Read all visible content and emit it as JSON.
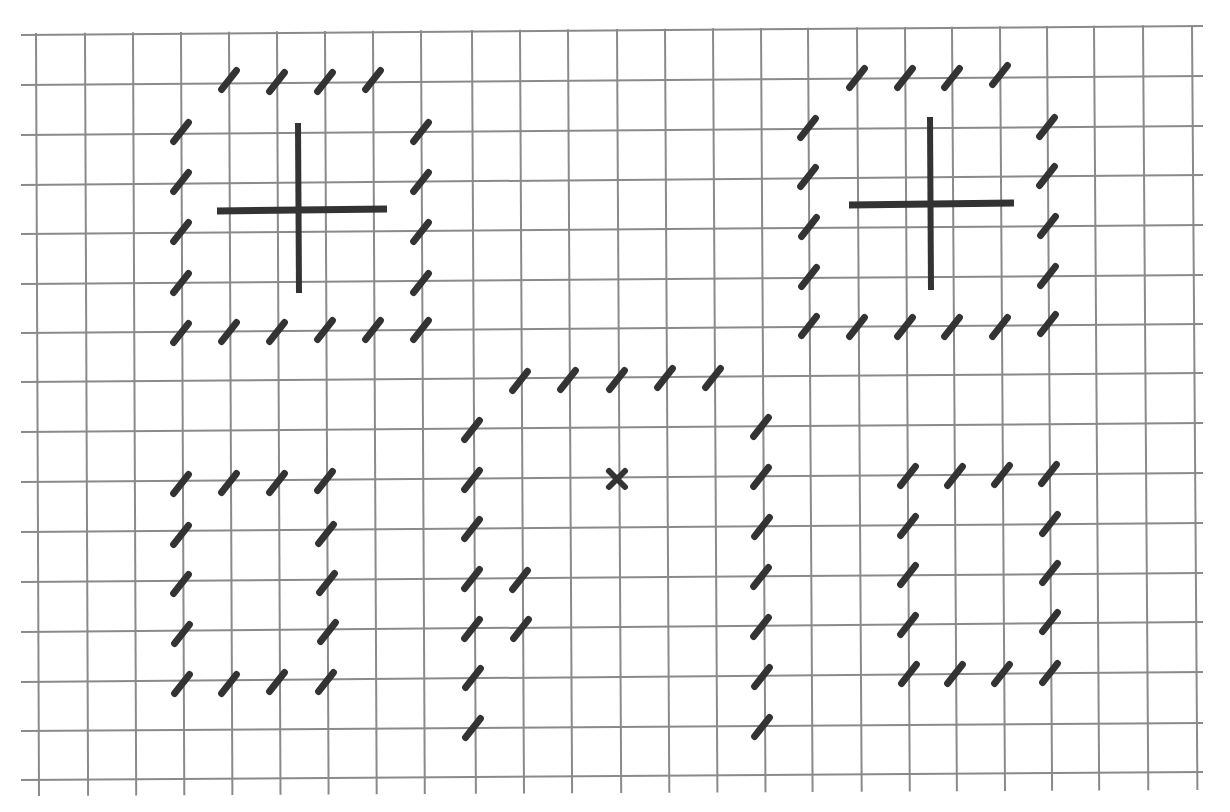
{
  "canvas": {
    "width": 1230,
    "height": 812,
    "background": "#ffffff"
  },
  "grid": {
    "line_color": "#8a8a8a",
    "line_width": 2,
    "columns_x": [
      36,
      85,
      133,
      181,
      229,
      277,
      325,
      373,
      421,
      472,
      520,
      568,
      617,
      665,
      713,
      761,
      808,
      857,
      905,
      952,
      1000,
      1047,
      1094,
      1143,
      1192
    ],
    "rows_y_left": [
      35,
      85,
      135,
      185,
      234,
      284,
      333,
      382,
      432,
      482,
      532,
      582,
      632,
      682,
      731,
      780
    ],
    "rows_y_right": [
      26,
      76,
      126,
      175,
      225,
      275,
      324,
      373,
      423,
      473,
      523,
      573,
      622,
      672,
      723,
      772
    ],
    "h_extent": [
      21,
      1203
    ],
    "v_extent_top": 27,
    "v_extent_bottom": 796
  },
  "mark_style": {
    "color": "#333333",
    "length": 24,
    "width": 7,
    "angle_deg": -52
  },
  "figures": [
    {
      "name": "top-left-box",
      "marks": [
        [
          229,
          80
        ],
        [
          277,
          82
        ],
        [
          325,
          82
        ],
        [
          373,
          80
        ],
        [
          181,
          132
        ],
        [
          181,
          182
        ],
        [
          181,
          232
        ],
        [
          181,
          283
        ],
        [
          421,
          132
        ],
        [
          421,
          182
        ],
        [
          421,
          232
        ],
        [
          421,
          283
        ],
        [
          181,
          333
        ],
        [
          229,
          332
        ],
        [
          277,
          332
        ],
        [
          325,
          330
        ],
        [
          373,
          330
        ],
        [
          421,
          330
        ]
      ],
      "plus": {
        "h": [
          217,
          211,
          387,
          209
        ],
        "v": [
          298,
          123,
          299,
          293
        ]
      }
    },
    {
      "name": "top-right-box",
      "marks": [
        [
          857,
          78
        ],
        [
          905,
          78
        ],
        [
          952,
          78
        ],
        [
          1000,
          75
        ],
        [
          808,
          128
        ],
        [
          808,
          177
        ],
        [
          809,
          227
        ],
        [
          809,
          277
        ],
        [
          1047,
          127
        ],
        [
          1047,
          176
        ],
        [
          1048,
          226
        ],
        [
          1048,
          276
        ],
        [
          809,
          326
        ],
        [
          857,
          327
        ],
        [
          905,
          327
        ],
        [
          952,
          327
        ],
        [
          1000,
          327
        ],
        [
          1048,
          324
        ]
      ],
      "plus": {
        "h": [
          849,
          205,
          1014,
          203
        ],
        "v": [
          930,
          117,
          931,
          290
        ]
      }
    },
    {
      "name": "center-box",
      "marks": [
        [
          520,
          381
        ],
        [
          568,
          380
        ],
        [
          617,
          380
        ],
        [
          665,
          378
        ],
        [
          713,
          378
        ],
        [
          472,
          430
        ],
        [
          472,
          480
        ],
        [
          472,
          529
        ],
        [
          472,
          579
        ],
        [
          472,
          629
        ],
        [
          473,
          678
        ],
        [
          473,
          728
        ],
        [
          761,
          427
        ],
        [
          761,
          477
        ],
        [
          762,
          527
        ],
        [
          761,
          577
        ],
        [
          761,
          627
        ],
        [
          762,
          677
        ],
        [
          762,
          727
        ],
        [
          520,
          580
        ],
        [
          521,
          629
        ]
      ],
      "x_mark": [
        617,
        479
      ]
    },
    {
      "name": "bottom-left-box",
      "marks": [
        [
          181,
          484
        ],
        [
          229,
          483
        ],
        [
          277,
          483
        ],
        [
          325,
          481
        ],
        [
          181,
          535
        ],
        [
          326,
          534
        ],
        [
          181,
          584
        ],
        [
          327,
          583
        ],
        [
          182,
          634
        ],
        [
          328,
          632
        ],
        [
          182,
          684
        ],
        [
          229,
          684
        ],
        [
          277,
          682
        ],
        [
          326,
          682
        ]
      ]
    },
    {
      "name": "bottom-right-box",
      "marks": [
        [
          908,
          476
        ],
        [
          955,
          476
        ],
        [
          1002,
          475
        ],
        [
          1049,
          474
        ],
        [
          908,
          526
        ],
        [
          1050,
          524
        ],
        [
          908,
          575
        ],
        [
          1050,
          573
        ],
        [
          908,
          625
        ],
        [
          1050,
          622
        ],
        [
          909,
          674
        ],
        [
          955,
          674
        ],
        [
          1002,
          674
        ],
        [
          1050,
          673
        ]
      ]
    }
  ]
}
